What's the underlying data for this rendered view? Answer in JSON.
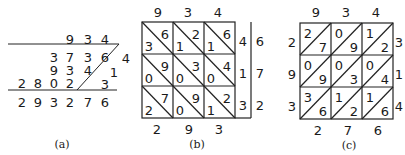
{
  "figures": [
    {
      "caption": "(a)",
      "multiplicand": [
        "9",
        "3",
        "4"
      ],
      "partial_rows": [
        {
          "digits": [
            "3",
            "7",
            "3",
            "6"
          ],
          "multiplier_digit": "4"
        },
        {
          "digits": [
            "9",
            "3",
            "4"
          ],
          "multiplier_digit": "1"
        },
        {
          "digits": [
            "2",
            "8",
            "0",
            "2"
          ],
          "multiplier_digit": "3"
        }
      ],
      "result": [
        "2",
        "9",
        "3",
        "2",
        "7",
        "6"
      ]
    },
    {
      "caption": "(b)",
      "top": [
        "9",
        "3",
        "4"
      ],
      "cells": [
        [
          {
            "lo": "3",
            "hi": "6"
          },
          {
            "lo": "1",
            "hi": "2"
          },
          {
            "lo": "1",
            "hi": "6"
          }
        ],
        [
          {
            "lo": "0",
            "hi": "9"
          },
          {
            "lo": "0",
            "hi": "3"
          },
          {
            "lo": "0",
            "hi": "4"
          }
        ],
        [
          {
            "lo": "2",
            "hi": "7"
          },
          {
            "lo": "0",
            "hi": "9"
          },
          {
            "lo": "1",
            "hi": "2"
          }
        ]
      ],
      "right_inner": [
        "4",
        "1",
        "3"
      ],
      "right_outer": [
        "6",
        "7",
        "2"
      ],
      "bottom": [
        "2",
        "9",
        "3"
      ]
    },
    {
      "caption": "(c)",
      "top": [
        "9",
        "3",
        "4"
      ],
      "left": [
        "2",
        "9",
        "3"
      ],
      "cells": [
        [
          {
            "tl": "2",
            "br": "7"
          },
          {
            "tl": "0",
            "br": "9"
          },
          {
            "tl": "1",
            "br": "2"
          }
        ],
        [
          {
            "tl": "0",
            "br": "9"
          },
          {
            "tl": "0",
            "br": "3"
          },
          {
            "tl": "0",
            "br": "4"
          }
        ],
        [
          {
            "tl": "3",
            "br": "6"
          },
          {
            "tl": "1",
            "br": "2"
          },
          {
            "tl": "1",
            "br": "6"
          }
        ]
      ],
      "right": [
        "3",
        "1",
        "4"
      ],
      "bottom": [
        "2",
        "7",
        "6"
      ]
    }
  ]
}
